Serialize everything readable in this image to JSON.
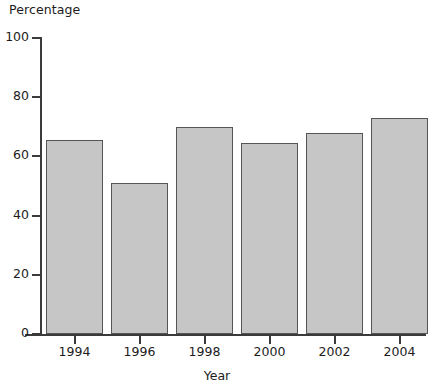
{
  "chart_data": {
    "type": "bar",
    "title": "",
    "xlabel": "Year",
    "ylabel": "Percentage",
    "categories": [
      "1994",
      "1996",
      "1998",
      "2000",
      "2002",
      "2004"
    ],
    "values": [
      65.5,
      51,
      70,
      64.5,
      68,
      73
    ],
    "ylim": [
      0,
      100
    ],
    "yticks": [
      "0",
      "20",
      "40",
      "60",
      "80",
      "100"
    ],
    "ytick_values": [
      0,
      20,
      40,
      60,
      80,
      100
    ],
    "grid": false,
    "legend": null,
    "legend_position": "none",
    "bar_fill_color": "#c6c6c6",
    "bar_border_color": "#555555",
    "axis_color": "#3b3b3b",
    "background_color": "#ffffff"
  }
}
